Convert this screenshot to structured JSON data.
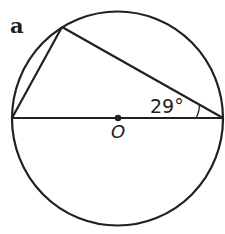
{
  "figure": {
    "part_label": "a",
    "angle_label": "29°",
    "center_label": "O",
    "stroke_color": "#231f20",
    "geometry": {
      "circle": {
        "cx": 118,
        "cy": 118.5,
        "r": 106
      },
      "diameter": {
        "left": [
          12,
          118
        ],
        "right": [
          223,
          118
        ]
      },
      "point_on_circle": [
        62,
        27
      ]
    }
  }
}
